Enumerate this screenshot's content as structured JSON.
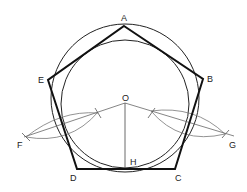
{
  "diagram": {
    "labels": {
      "A": "A",
      "B": "B",
      "C": "C",
      "D": "D",
      "E": "E",
      "F": "F",
      "G": "G",
      "O": "O",
      "H": "H"
    },
    "colors": {
      "stroke": "#111111",
      "thin": "#555555",
      "background": "#ffffff"
    }
  }
}
